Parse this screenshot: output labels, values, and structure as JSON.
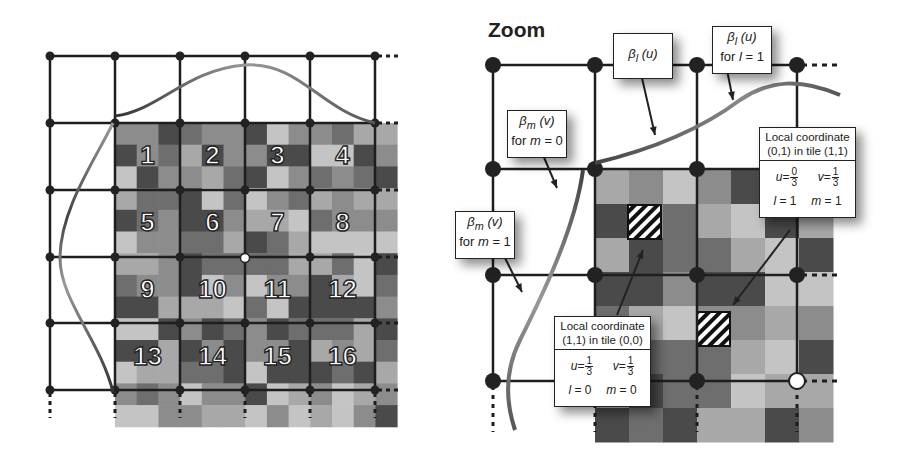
{
  "left_panel": {
    "tile_numbers": [
      "1",
      "2",
      "3",
      "4",
      "5",
      "6",
      "7",
      "8",
      "9",
      "10",
      "11",
      "12",
      "13",
      "14",
      "15",
      "16"
    ]
  },
  "right_panel": {
    "title": "Zoom",
    "labels": {
      "beta_l": {
        "symbol": "β",
        "sub": "l",
        "arg": "(u)"
      },
      "beta_l_for": {
        "symbol": "β",
        "sub": "l",
        "arg": "(u)",
        "line2_pre": "for ",
        "var": "l",
        "line2_post": " = 1"
      },
      "beta_m0": {
        "symbol": "β",
        "sub": "m",
        "arg": "(v)",
        "line2_pre": "for ",
        "var": "m",
        "line2_post": " = 0"
      },
      "beta_m1": {
        "symbol": "β",
        "sub": "m",
        "arg": "(v)",
        "line2_pre": "for ",
        "var": "m",
        "line2_post": " = 1"
      }
    },
    "coord_box_1": {
      "head_line1": "Local coordinate",
      "head_line2": "(0,1) in tile (1,1)",
      "u_var": "u",
      "u_num": "0",
      "u_den": "3",
      "v_var": "v",
      "v_num": "1",
      "v_den": "3",
      "l_var": "l",
      "l_val": " = 1",
      "m_var": "m",
      "m_val": " = 1"
    },
    "coord_box_2": {
      "head_line1": "Local coordinate",
      "head_line2": "(1,1) in tile (0,0)",
      "u_var": "u",
      "u_num": "1",
      "u_den": "3",
      "v_var": "v",
      "v_num": "1",
      "v_den": "3",
      "l_var": "l",
      "l_val": " = 0",
      "m_var": "m",
      "m_val": " = 0"
    }
  },
  "colors": {
    "grid_line": "#1e1e1e",
    "node": "#222222",
    "curve_dark": "#444444",
    "curve_light": "#9a9a9a",
    "gray_levels": [
      "#4a4a4a",
      "#6e6e6e",
      "#8c8c8c",
      "#a8a8a8",
      "#c4c4c4"
    ]
  }
}
